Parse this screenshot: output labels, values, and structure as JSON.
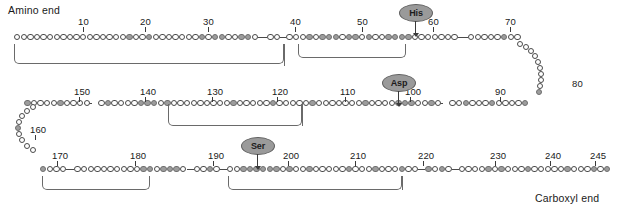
{
  "diagram": {
    "type": "protein-sequence-schematic",
    "terminus": {
      "amino_label": "Amino end",
      "carboxyl_label": "Carboxyl end"
    },
    "colors": {
      "residue_fill": "#ffffff",
      "residue_shaded_fill": "#9d9d9d",
      "residue_stroke": "#4a4a4a",
      "label_oval_fill": "#9a9a9a",
      "text": "#1a1a1a",
      "bracket": "#6a6a6a"
    },
    "total_residues": 245,
    "rows": [
      {
        "name": "row-1",
        "direction": "left-to-right",
        "start": 1,
        "end": 73
      },
      {
        "name": "row-2",
        "direction": "right-to-left",
        "start": 84,
        "end": 157
      },
      {
        "name": "row-3",
        "direction": "left-to-right",
        "start": 165,
        "end": 245
      }
    ],
    "position_ticks": [
      {
        "label": "10",
        "row": 1,
        "x": 78,
        "y": 16
      },
      {
        "label": "20",
        "row": 1,
        "x": 140,
        "y": 16
      },
      {
        "label": "30",
        "row": 1,
        "x": 203,
        "y": 16
      },
      {
        "label": "40",
        "row": 1,
        "x": 290,
        "y": 16
      },
      {
        "label": "50",
        "row": 1,
        "x": 357,
        "y": 16
      },
      {
        "label": "60",
        "row": 1,
        "x": 428,
        "y": 16
      },
      {
        "label": "70",
        "row": 1,
        "x": 505,
        "y": 16
      },
      {
        "label": "80",
        "row": 1,
        "x": 572,
        "y": 78
      },
      {
        "label": "90",
        "row": 2,
        "x": 495,
        "y": 86
      },
      {
        "label": "100",
        "row": 2,
        "x": 405,
        "y": 86
      },
      {
        "label": "110",
        "row": 2,
        "x": 340,
        "y": 86
      },
      {
        "label": "120",
        "row": 2,
        "x": 272,
        "y": 86
      },
      {
        "label": "130",
        "row": 2,
        "x": 207,
        "y": 86
      },
      {
        "label": "140",
        "row": 2,
        "x": 140,
        "y": 86
      },
      {
        "label": "150",
        "row": 2,
        "x": 74,
        "y": 86
      },
      {
        "label": "160",
        "row": 2,
        "x": 30,
        "y": 124
      },
      {
        "label": "170",
        "row": 3,
        "x": 52,
        "y": 150
      },
      {
        "label": "180",
        "row": 3,
        "x": 130,
        "y": 150
      },
      {
        "label": "190",
        "row": 3,
        "x": 208,
        "y": 150
      },
      {
        "label": "200",
        "row": 3,
        "x": 283,
        "y": 150
      },
      {
        "label": "210",
        "row": 3,
        "x": 350,
        "y": 150
      },
      {
        "label": "220",
        "row": 3,
        "x": 418,
        "y": 150
      },
      {
        "label": "230",
        "row": 3,
        "x": 490,
        "y": 150
      },
      {
        "label": "240",
        "row": 3,
        "x": 545,
        "y": 150
      },
      {
        "label": "245",
        "row": 3,
        "x": 590,
        "y": 150
      }
    ],
    "catalytic_residues": [
      {
        "name": "His",
        "position": 57,
        "oval_x": 399,
        "oval_y": 4,
        "arrow_x": 415,
        "arrow_top": 21,
        "arrow_len": 12
      },
      {
        "name": "Asp",
        "position": 102,
        "oval_x": 382,
        "oval_y": 74,
        "arrow_x": 398,
        "arrow_top": 91,
        "arrow_len": 12
      },
      {
        "name": "Ser",
        "position": 195,
        "oval_x": 241,
        "oval_y": 137,
        "arrow_x": 257,
        "arrow_top": 154,
        "arrow_len": 12
      }
    ],
    "shaded_positions_row1": [
      18,
      21,
      29,
      31,
      32,
      35,
      36,
      43,
      45,
      46,
      47,
      49,
      50,
      52,
      55,
      56,
      57,
      58,
      71
    ],
    "shaded_positions_row2": [
      84,
      89,
      93,
      97,
      100,
      101,
      102,
      107,
      115,
      121,
      127,
      137,
      139,
      140,
      141,
      146,
      152,
      157
    ],
    "shaded_positions_row3": [
      165,
      179,
      180,
      182,
      183,
      184,
      188,
      192,
      193,
      194,
      195,
      196,
      197,
      199,
      202,
      208,
      212,
      216,
      219,
      221,
      227,
      229,
      233,
      239,
      243,
      245
    ],
    "brackets": [
      {
        "name": "bridge-1-122",
        "x": 14,
        "y": 44,
        "w": 270,
        "h": 20
      },
      {
        "name": "bridge-42-58",
        "x": 298,
        "y": 44,
        "w": 108,
        "h": 14
      },
      {
        "name": "bridge-136-201",
        "x": 168,
        "y": 104,
        "w": 134,
        "h": 22
      },
      {
        "name": "bridge-168-182",
        "x": 42,
        "y": 176,
        "w": 108,
        "h": 14
      },
      {
        "name": "bridge-191-220",
        "x": 228,
        "y": 176,
        "w": 174,
        "h": 14
      }
    ]
  }
}
